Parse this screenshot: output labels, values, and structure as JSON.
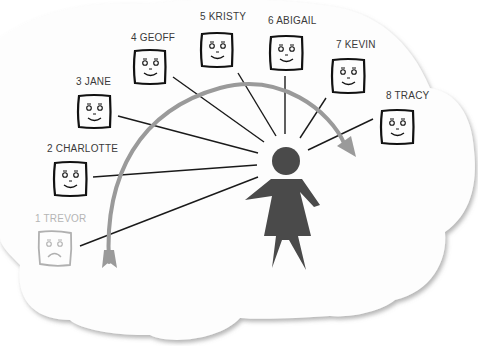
{
  "diagram": {
    "type": "ranking-of-people-around-central-figure",
    "background_shape": "cloud",
    "colors": {
      "cloud_fill": "#fdfdfd",
      "cloud_shadow": "#9a9a9a",
      "person": "#4a4a4a",
      "arrow": "#9a9a9a",
      "line": "#1a1a1a",
      "face_active": "#111111",
      "face_faded": "#b0b0b0",
      "label_active": "#3a3a3a",
      "label_faded": "#b5b5b5"
    },
    "people": [
      {
        "rank": 1,
        "name": "TREVOR",
        "label": "1 TREVOR",
        "mood": "sad",
        "faded": true
      },
      {
        "rank": 2,
        "name": "CHARLOTTE",
        "label": "2 CHARLOTTE",
        "mood": "happy",
        "faded": false
      },
      {
        "rank": 3,
        "name": "JANE",
        "label": "3 JANE",
        "mood": "happy",
        "faded": false
      },
      {
        "rank": 4,
        "name": "GEOFF",
        "label": "4 GEOFF",
        "mood": "happy",
        "faded": false
      },
      {
        "rank": 5,
        "name": "KRISTY",
        "label": "5 KRISTY",
        "mood": "happy",
        "faded": false
      },
      {
        "rank": 6,
        "name": "ABIGAIL",
        "label": "6 ABIGAIL",
        "mood": "happy",
        "faded": false
      },
      {
        "rank": 7,
        "name": "KEVIN",
        "label": "7 KEVIN",
        "mood": "happy",
        "faded": false
      },
      {
        "rank": 8,
        "name": "TRACY",
        "label": "8 TRACY",
        "mood": "happy",
        "faded": false
      }
    ],
    "center_figure": "woman-silhouette",
    "arrow_direction": "clockwise from 1 to 8"
  }
}
